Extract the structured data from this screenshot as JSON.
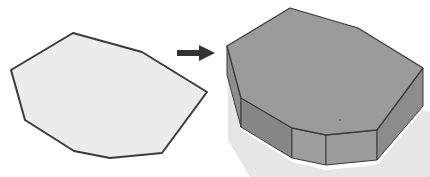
{
  "diagram": {
    "colors": {
      "flat_fill": "#ececec",
      "stroke": "#3a3a3a",
      "top_face": "#9b9b9b",
      "side_dark": "#878787",
      "side_light": "#9e9e9e",
      "right_side": "#8c8c8c",
      "shadow": "#dcdcdc",
      "arrow": "#333333"
    },
    "flat_polygon": {
      "points": "73,33 142,52 207,92 162,153 110,158 74,151 25,120 11,70"
    },
    "arrow": {
      "direction": "right"
    },
    "prism": {
      "top_face": "290,8 358,28 423,68 377,130 326,135 292,128 241,98 227,46",
      "sides": [
        {
          "name": "left-back",
          "points": "227,46 241,98 241,127 227,75"
        },
        {
          "name": "left-front",
          "points": "241,98 292,128 292,158 241,127"
        },
        {
          "name": "front-left",
          "points": "292,128 326,135 326,165 292,158"
        },
        {
          "name": "front-right",
          "points": "326,135 377,130 377,160 326,165"
        },
        {
          "name": "right",
          "points": "377,130 423,68 423,106 377,160"
        }
      ],
      "shadow": "228,80 241,130 292,162 326,170 377,165 423,110 430,112 430,177 250,177 228,140"
    }
  }
}
